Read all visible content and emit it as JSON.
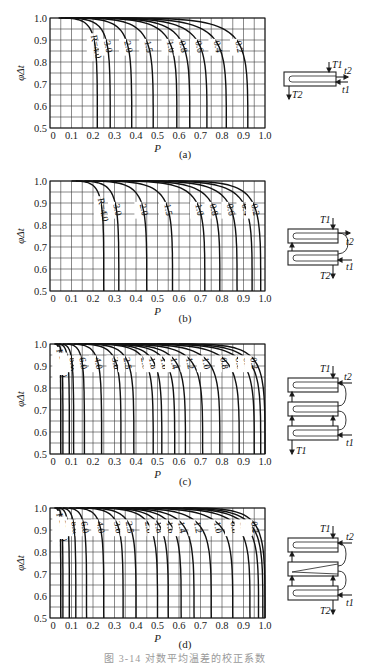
{
  "figure_caption": "图 3-14  对数平均温差的校正系数",
  "chart_data": [
    {
      "type": "line",
      "panel_label": "(a)",
      "title": "",
      "xlabel": "P",
      "ylabel": "φΔt",
      "xlim": [
        0,
        1.0
      ],
      "ylim": [
        0.5,
        1.0
      ],
      "xticks": [
        "0",
        "0.1",
        "0.2",
        "0.3",
        "0.4",
        "0.5",
        "0.6",
        "0.7",
        "0.8",
        "0.9",
        "1.0"
      ],
      "yticks": [
        "0.5",
        "0.6",
        "0.7",
        "0.8",
        "0.9",
        "1.0"
      ],
      "grid": true,
      "legend_position": "inline curve labels",
      "schematic": "1 shell pass, 2 tube passes",
      "schematic_labels": [
        "T1",
        "t2",
        "t1",
        "T2"
      ],
      "series": [
        {
          "name": "R=4.0",
          "label": "R=4.0",
          "p_at_phi_0_5": 0.22,
          "p_start_drop": 0.04
        },
        {
          "name": "3.0",
          "label": "3.0",
          "p_at_phi_0_5": 0.28,
          "p_start_drop": 0.05
        },
        {
          "name": "2.0",
          "label": "2.0",
          "p_at_phi_0_5": 0.38,
          "p_start_drop": 0.07
        },
        {
          "name": "1.5",
          "label": "1.5",
          "p_at_phi_0_5": 0.48,
          "p_start_drop": 0.09
        },
        {
          "name": "1.0",
          "label": "1.0",
          "p_at_phi_0_5": 0.59,
          "p_start_drop": 0.12
        },
        {
          "name": "0.8",
          "label": "0.8",
          "p_at_phi_0_5": 0.65,
          "p_start_drop": 0.14
        },
        {
          "name": "0.6",
          "label": "0.6",
          "p_at_phi_0_5": 0.73,
          "p_start_drop": 0.16
        },
        {
          "name": "0.4",
          "label": "0.4",
          "p_at_phi_0_5": 0.82,
          "p_start_drop": 0.2
        },
        {
          "name": "0.2",
          "label": "0.2",
          "p_at_phi_0_5": 0.92,
          "p_start_drop": 0.3
        }
      ]
    },
    {
      "type": "line",
      "panel_label": "(b)",
      "title": "",
      "xlabel": "P",
      "ylabel": "φΔt",
      "xlim": [
        0,
        1.0
      ],
      "ylim": [
        0.5,
        1.0
      ],
      "xticks": [
        "0",
        "0.1",
        "0.2",
        "0.3",
        "0.4",
        "0.5",
        "0.6",
        "0.7",
        "0.8",
        "0.9",
        "1.0"
      ],
      "yticks": [
        "0.5",
        "0.6",
        "0.7",
        "0.8",
        "0.9",
        "1.0"
      ],
      "grid": true,
      "legend_position": "inline curve labels",
      "schematic": "2 shell passes, 4 tube passes",
      "schematic_labels": [
        "T1",
        "t2",
        "t1",
        "T2"
      ],
      "series": [
        {
          "name": "R=4.0",
          "label": "R=4.0",
          "p_at_phi_0_5": 0.25,
          "p_start_drop": 0.1
        },
        {
          "name": "3.0",
          "label": "3.0",
          "p_at_phi_0_5": 0.32,
          "p_start_drop": 0.12
        },
        {
          "name": "2.0",
          "label": "2.0",
          "p_at_phi_0_5": 0.45,
          "p_start_drop": 0.16
        },
        {
          "name": "1.5",
          "label": "1.5",
          "p_at_phi_0_5": 0.57,
          "p_start_drop": 0.2
        },
        {
          "name": "1.0",
          "label": "1.0",
          "p_at_phi_0_5": 0.72,
          "p_start_drop": 0.28
        },
        {
          "name": "0.8",
          "label": "0.8",
          "p_at_phi_0_5": 0.79,
          "p_start_drop": 0.32
        },
        {
          "name": "0.6",
          "label": "0.6",
          "p_at_phi_0_5": 0.87,
          "p_start_drop": 0.38
        },
        {
          "name": "0.4",
          "label": "0.4",
          "p_at_phi_0_5": 0.94,
          "p_start_drop": 0.45
        },
        {
          "name": "0.2",
          "label": "0.2",
          "p_at_phi_0_5": 0.98,
          "p_start_drop": 0.55
        }
      ]
    },
    {
      "type": "line",
      "panel_label": "(c)",
      "title": "",
      "xlabel": "P",
      "ylabel": "φΔt",
      "xlim": [
        0,
        1.0
      ],
      "ylim": [
        0.5,
        1.0
      ],
      "xticks": [
        "0",
        "0.1",
        "0.2",
        "0.3",
        "0.4",
        "0.5",
        "0.6",
        "0.7",
        "0.8",
        "0.9",
        "1.0"
      ],
      "yticks": [
        "0.5",
        "0.6",
        "0.7",
        "0.8",
        "0.9",
        "1.0"
      ],
      "grid": true,
      "legend_position": "inline curve labels",
      "schematic": "3 shell passes, 6 or more tube passes",
      "schematic_labels": [
        "T1",
        "t2",
        "t1",
        "T1"
      ],
      "series": [
        {
          "name": "R=20.0",
          "label": "R=20.0",
          "p_at_phi_0_5": 0.05,
          "p_start_drop": 0.02
        },
        {
          "name": "15.0",
          "label": "15.0",
          "p_at_phi_0_5": 0.06,
          "p_start_drop": 0.025
        },
        {
          "name": "10.0",
          "label": "10.0",
          "p_at_phi_0_5": 0.09,
          "p_start_drop": 0.03
        },
        {
          "name": "8.0",
          "label": "8.0",
          "p_at_phi_0_5": 0.11,
          "p_start_drop": 0.04
        },
        {
          "name": "6.0",
          "label": "6.0",
          "p_at_phi_0_5": 0.16,
          "p_start_drop": 0.06
        },
        {
          "name": "4.0",
          "label": "4.0",
          "p_at_phi_0_5": 0.24,
          "p_start_drop": 0.08
        },
        {
          "name": "3.0",
          "label": "3.0",
          "p_at_phi_0_5": 0.33,
          "p_start_drop": 0.11
        },
        {
          "name": "2.5",
          "label": "2.5",
          "p_at_phi_0_5": 0.39,
          "p_start_drop": 0.13
        },
        {
          "name": "2.0",
          "label": "2.0",
          "p_at_phi_0_5": 0.48,
          "p_start_drop": 0.16
        },
        {
          "name": "1.8",
          "label": "1.8",
          "p_at_phi_0_5": 0.52,
          "p_start_drop": 0.18
        },
        {
          "name": "1.6",
          "label": "1.6",
          "p_at_phi_0_5": 0.58,
          "p_start_drop": 0.2
        },
        {
          "name": "1.4",
          "label": "1.4",
          "p_at_phi_0_5": 0.63,
          "p_start_drop": 0.22
        },
        {
          "name": "1.2",
          "label": "1.2",
          "p_at_phi_0_5": 0.71,
          "p_start_drop": 0.25
        },
        {
          "name": "1.0",
          "label": "1.0",
          "p_at_phi_0_5": 0.79,
          "p_start_drop": 0.3
        },
        {
          "name": "0.8",
          "label": "0.8",
          "p_at_phi_0_5": 0.88,
          "p_start_drop": 0.35
        },
        {
          "name": "0.6",
          "label": "0.6",
          "p_at_phi_0_5": 0.95,
          "p_start_drop": 0.42
        },
        {
          "name": "0.4",
          "label": "0.4",
          "p_at_phi_0_5": 0.98,
          "p_start_drop": 0.5
        },
        {
          "name": "0.2",
          "label": "0.2",
          "p_at_phi_0_5": 1.0,
          "p_start_drop": 0.6
        }
      ]
    },
    {
      "type": "line",
      "panel_label": "(d)",
      "title": "",
      "xlabel": "P",
      "ylabel": "φΔt",
      "xlim": [
        0,
        1.0
      ],
      "ylim": [
        0.5,
        1.0
      ],
      "xticks": [
        "0",
        "0.1",
        "0.2",
        "0.3",
        "0.4",
        "0.5",
        "0.6",
        "0.7",
        "0.8",
        "0.9",
        "1.0"
      ],
      "yticks": [
        "0.5",
        "0.6",
        "0.7",
        "0.8",
        "0.9",
        "1.0"
      ],
      "grid": true,
      "legend_position": "inline curve labels",
      "schematic": "4 shell passes, 8 or more tube passes",
      "schematic_labels": [
        "T1",
        "t2",
        "t1",
        "T2"
      ],
      "series": [
        {
          "name": "R=20.0",
          "label": "R=20.0",
          "p_at_phi_0_5": 0.05,
          "p_start_drop": 0.02
        },
        {
          "name": "15.0",
          "label": "15.0",
          "p_at_phi_0_5": 0.06,
          "p_start_drop": 0.025
        },
        {
          "name": "10.0",
          "label": "10.0",
          "p_at_phi_0_5": 0.09,
          "p_start_drop": 0.03
        },
        {
          "name": "8.0",
          "label": "8.0",
          "p_at_phi_0_5": 0.12,
          "p_start_drop": 0.04
        },
        {
          "name": "6.0",
          "label": "6.0",
          "p_at_phi_0_5": 0.17,
          "p_start_drop": 0.06
        },
        {
          "name": "4.0",
          "label": "4.0",
          "p_at_phi_0_5": 0.25,
          "p_start_drop": 0.09
        },
        {
          "name": "3.0",
          "label": "3.0",
          "p_at_phi_0_5": 0.34,
          "p_start_drop": 0.12
        },
        {
          "name": "2.5",
          "label": "2.5",
          "p_at_phi_0_5": 0.4,
          "p_start_drop": 0.14
        },
        {
          "name": "2.0",
          "label": "2.0",
          "p_at_phi_0_5": 0.5,
          "p_start_drop": 0.17
        },
        {
          "name": "1.8",
          "label": "1.8",
          "p_at_phi_0_5": 0.55,
          "p_start_drop": 0.19
        },
        {
          "name": "1.6",
          "label": "1.6",
          "p_at_phi_0_5": 0.61,
          "p_start_drop": 0.21
        },
        {
          "name": "1.4",
          "label": "1.4",
          "p_at_phi_0_5": 0.67,
          "p_start_drop": 0.23
        },
        {
          "name": "1.2",
          "label": "1.2",
          "p_at_phi_0_5": 0.75,
          "p_start_drop": 0.27
        },
        {
          "name": "1.0",
          "label": "1.0",
          "p_at_phi_0_5": 0.85,
          "p_start_drop": 0.32
        },
        {
          "name": "0.8",
          "label": "0.8",
          "p_at_phi_0_5": 0.93,
          "p_start_drop": 0.38
        },
        {
          "name": "0.6",
          "label": "0.6",
          "p_at_phi_0_5": 0.97,
          "p_start_drop": 0.45
        },
        {
          "name": "0.4",
          "label": "0.4",
          "p_at_phi_0_5": 0.99,
          "p_start_drop": 0.52
        },
        {
          "name": "0.2",
          "label": "0.2",
          "p_at_phi_0_5": 1.0,
          "p_start_drop": 0.62
        }
      ]
    }
  ]
}
